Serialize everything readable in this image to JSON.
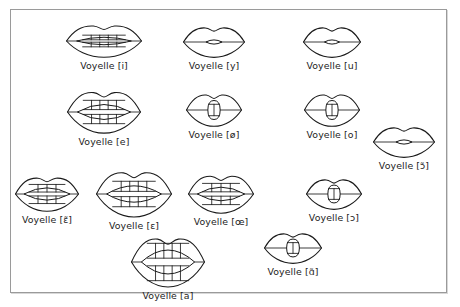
{
  "figure": {
    "border_color": "#9a9a9a",
    "background_color": "#ffffff",
    "ink_color": "#1a1a1a",
    "text_color": "#1c1c1c",
    "label_prefix": "Voyelle",
    "width": 460,
    "height": 307
  },
  "chart_data": {
    "type": "diagram",
    "item_count": 12,
    "symbols": [
      "i",
      "y",
      "u",
      "e",
      "ø",
      "o",
      "ɛ̃",
      "ɛ",
      "œ",
      "ɔ",
      "ɔ̃",
      "a",
      "ɑ̃"
    ],
    "rows": [
      [
        "i",
        "y",
        "u"
      ],
      [
        "e",
        "ø",
        "o"
      ],
      [
        "ɛ̃",
        "ɛ",
        "œ",
        "ɔ"
      ],
      [
        "a",
        "ɑ̃"
      ],
      [
        "ɔ̃"
      ]
    ]
  },
  "vowels": [
    {
      "id": "vowel-i",
      "symbol": "i",
      "label": "Voyelle [i]",
      "x": 103,
      "y": 22,
      "mouth_width": 76,
      "mouth_height": 34,
      "aperture": "wide-slit",
      "teeth_rows": 2,
      "teeth_count": 5,
      "description": "lips spread wide, narrow horizontal opening, both teeth rows visible"
    },
    {
      "id": "vowel-y",
      "symbol": "y",
      "label": "Voyelle [y]",
      "x": 213,
      "y": 24,
      "mouth_width": 62,
      "mouth_height": 32,
      "aperture": "small-lens",
      "teeth_rows": 0,
      "teeth_count": 0,
      "description": "lips rounded and protruded, tiny lens-shaped opening"
    },
    {
      "id": "vowel-u",
      "symbol": "u",
      "label": "Voyelle [u]",
      "x": 331,
      "y": 24,
      "mouth_width": 58,
      "mouth_height": 32,
      "aperture": "small-lens",
      "teeth_rows": 0,
      "teeth_count": 0,
      "description": "lips strongly rounded, very small central opening"
    },
    {
      "id": "vowel-e",
      "symbol": "e",
      "label": "Voyelle [e]",
      "x": 103,
      "y": 88,
      "mouth_width": 74,
      "mouth_height": 44,
      "aperture": "open-slit",
      "teeth_rows": 2,
      "teeth_count": 5,
      "description": "mouth moderately open, upper and lower teeth rows visible"
    },
    {
      "id": "vowel-oe-slashed",
      "symbol": "ø",
      "label": "Voyelle [ø]",
      "x": 213,
      "y": 91,
      "mouth_width": 56,
      "mouth_height": 34,
      "aperture": "oval",
      "teeth_rows": 1,
      "teeth_count": 3,
      "description": "rounded lips with vertical oval opening, teeth inside"
    },
    {
      "id": "vowel-o",
      "symbol": "o",
      "label": "Voyelle [o]",
      "x": 331,
      "y": 91,
      "mouth_width": 56,
      "mouth_height": 34,
      "aperture": "oval",
      "teeth_rows": 1,
      "teeth_count": 3,
      "description": "rounded lips with vertical oval opening"
    },
    {
      "id": "vowel-e-nasal",
      "symbol": "ɛ̃",
      "label": "Voyelle [ɛ̃]",
      "x": 46,
      "y": 174,
      "mouth_width": 64,
      "mouth_height": 36,
      "aperture": "open-slit",
      "teeth_rows": 2,
      "teeth_count": 4,
      "description": "nasal open-e, lips spread with teeth visible"
    },
    {
      "id": "vowel-epsilon",
      "symbol": "ɛ",
      "label": "Voyelle [ɛ]",
      "x": 133,
      "y": 168,
      "mouth_width": 76,
      "mouth_height": 48,
      "aperture": "open-slit",
      "teeth_rows": 2,
      "teeth_count": 5,
      "description": "mouth well open, both teeth rows clearly visible"
    },
    {
      "id": "vowel-oe",
      "symbol": "œ",
      "label": "Voyelle [œ]",
      "x": 220,
      "y": 172,
      "mouth_width": 66,
      "mouth_height": 40,
      "aperture": "open-slit",
      "teeth_rows": 2,
      "teeth_count": 4,
      "description": "slightly rounded open lips with teeth visible"
    },
    {
      "id": "vowel-open-o",
      "symbol": "ɔ",
      "label": "Voyelle [ɔ]",
      "x": 333,
      "y": 176,
      "mouth_width": 56,
      "mouth_height": 32,
      "aperture": "oval",
      "teeth_rows": 1,
      "teeth_count": 3,
      "description": "rounded lips with oval opening"
    },
    {
      "id": "vowel-open-o-nasal",
      "symbol": "ɔ̃",
      "label": "Voyelle [ɔ̃]",
      "x": 403,
      "y": 124,
      "mouth_width": 62,
      "mouth_height": 32,
      "aperture": "small-lens",
      "teeth_rows": 0,
      "teeth_count": 0,
      "description": "nasal open-o, rounded lips with small opening"
    },
    {
      "id": "vowel-a",
      "symbol": "a",
      "label": "Voyelle [a]",
      "x": 167,
      "y": 234,
      "mouth_width": 74,
      "mouth_height": 52,
      "aperture": "wide-open",
      "teeth_rows": 2,
      "teeth_count": 5,
      "description": "mouth maximally open, both teeth rows well separated"
    },
    {
      "id": "vowel-a-nasal",
      "symbol": "ɑ̃",
      "label": "Voyelle [ɑ̃]",
      "x": 292,
      "y": 230,
      "mouth_width": 58,
      "mouth_height": 32,
      "aperture": "oval",
      "teeth_rows": 1,
      "teeth_count": 3,
      "description": "nasal a, rounded lips with oval opening"
    }
  ]
}
